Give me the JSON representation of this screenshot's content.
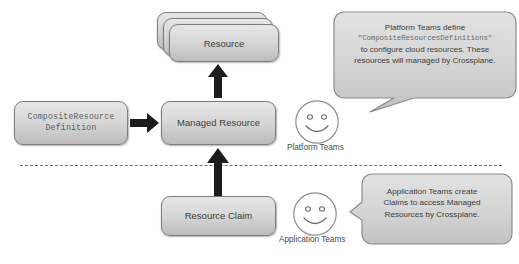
{
  "diagram": {
    "boxes": {
      "composite_resource_definition": "CompositeResource\nDefinition",
      "managed_resource": "Managed Resource",
      "resource": "Resource",
      "resource_claim": "Resource Claim"
    },
    "personas": {
      "platform": {
        "label": "Platform Teams",
        "face": "smiley-face"
      },
      "application": {
        "label": "Application Teams",
        "face": "smiley-face"
      }
    },
    "callouts": {
      "platform": {
        "line1": "Platform Teams define",
        "code": "\"CompositeResourcesDefinitions\"",
        "line3": "to configure cloud resources. These",
        "line4": "resources will managed by Crossplane."
      },
      "application": {
        "line1": "Application Teams create",
        "line2": "Claims to access Managed",
        "line3": "Resources by Crossplane."
      }
    },
    "arrows": {
      "crd_to_managed_resource": "arrow-right",
      "managed_resource_to_resource": "arrow-up",
      "claim_to_managed_resource": "arrow-up"
    },
    "divider": "dashed-separator",
    "colors": {
      "box_fill_top": "#e6e6e6",
      "box_fill_bottom": "#bdbdbd",
      "box_border": "#7d7d7d",
      "arrow": "#1c1c1c",
      "callout_fill": "#d2d2d2",
      "callout_border": "#8a8a8a",
      "divider": "#6f6f6f",
      "text": "#3c3c3c"
    }
  }
}
